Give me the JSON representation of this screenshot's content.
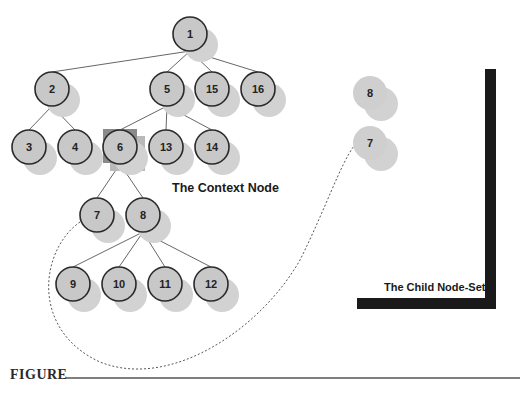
{
  "figure": {
    "label": "FIGURE"
  },
  "captions": {
    "context_node": "The Context Node",
    "child_node_set": "The Child Node-Set"
  },
  "colors": {
    "node_fill": "#c8c8c8",
    "node_stroke": "#2a2a2a",
    "shadow": "#d2d2d2",
    "context_highlight_dark": "#8a8a8a",
    "context_highlight_light": "#b9b9b9",
    "bracket": "#1a1a1a",
    "edge": "#555555"
  },
  "tree": {
    "nodes": [
      {
        "id": "1",
        "x": 190,
        "y": 34
      },
      {
        "id": "2",
        "x": 52,
        "y": 89
      },
      {
        "id": "5",
        "x": 167,
        "y": 89
      },
      {
        "id": "15",
        "x": 212,
        "y": 89
      },
      {
        "id": "16",
        "x": 258,
        "y": 89
      },
      {
        "id": "3",
        "x": 29,
        "y": 147
      },
      {
        "id": "4",
        "x": 75,
        "y": 147
      },
      {
        "id": "6",
        "x": 120,
        "y": 147
      },
      {
        "id": "13",
        "x": 166,
        "y": 147
      },
      {
        "id": "14",
        "x": 212,
        "y": 147
      },
      {
        "id": "7",
        "x": 97,
        "y": 215
      },
      {
        "id": "8",
        "x": 143,
        "y": 215
      },
      {
        "id": "9",
        "x": 73,
        "y": 284
      },
      {
        "id": "10",
        "x": 119,
        "y": 284
      },
      {
        "id": "11",
        "x": 165,
        "y": 284
      },
      {
        "id": "12",
        "x": 211,
        "y": 284
      }
    ],
    "edges": [
      [
        "1",
        "2"
      ],
      [
        "1",
        "5"
      ],
      [
        "1",
        "15"
      ],
      [
        "1",
        "16"
      ],
      [
        "2",
        "3"
      ],
      [
        "2",
        "4"
      ],
      [
        "5",
        "6"
      ],
      [
        "5",
        "13"
      ],
      [
        "5",
        "14"
      ],
      [
        "6",
        "7"
      ],
      [
        "6",
        "8"
      ],
      [
        "8",
        "9"
      ],
      [
        "8",
        "10"
      ],
      [
        "8",
        "11"
      ],
      [
        "8",
        "12"
      ]
    ],
    "context_node": "6"
  },
  "child_node_set": {
    "nodes": [
      {
        "id": "8",
        "x": 370,
        "y": 93
      },
      {
        "id": "7",
        "x": 370,
        "y": 143
      }
    ]
  }
}
